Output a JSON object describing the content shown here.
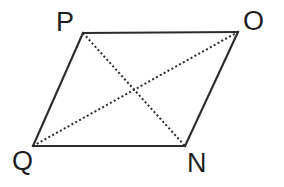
{
  "figure": {
    "kind": "parallelogram-with-diagonals",
    "background_color": "#ffffff",
    "stroke_color": "#2b2b2b",
    "label_color": "#1f1f1f",
    "width": 284,
    "height": 187,
    "vertices": [
      {
        "name": "P",
        "label": "P",
        "x": 83,
        "y": 33,
        "label_x": 56,
        "label_y": 9
      },
      {
        "name": "O",
        "label": "O",
        "x": 238,
        "y": 32,
        "label_x": 243,
        "label_y": 8
      },
      {
        "name": "N",
        "label": "N",
        "x": 185,
        "y": 146,
        "label_x": 187,
        "label_y": 150
      },
      {
        "name": "Q",
        "label": "Q",
        "x": 33,
        "y": 146,
        "label_x": 12,
        "label_y": 148
      }
    ],
    "edges": [
      {
        "name": "edge-PO",
        "from": "P",
        "to": "O",
        "style": "solid",
        "x1": 83,
        "y1": 33,
        "x2": 238,
        "y2": 32
      },
      {
        "name": "edge-ON",
        "from": "O",
        "to": "N",
        "style": "solid",
        "x1": 238,
        "y1": 32,
        "x2": 185,
        "y2": 146
      },
      {
        "name": "edge-NQ",
        "from": "N",
        "to": "Q",
        "style": "solid",
        "x1": 185,
        "y1": 146,
        "x2": 33,
        "y2": 146
      },
      {
        "name": "edge-QP",
        "from": "Q",
        "to": "P",
        "style": "solid",
        "x1": 33,
        "y1": 146,
        "x2": 83,
        "y2": 33
      }
    ],
    "diagonals": [
      {
        "name": "diagonal-PN",
        "from": "P",
        "to": "N",
        "style": "dotted",
        "x1": 83,
        "y1": 33,
        "x2": 185,
        "y2": 146
      },
      {
        "name": "diagonal-QO",
        "from": "Q",
        "to": "O",
        "style": "dotted",
        "x1": 33,
        "y1": 146,
        "x2": 238,
        "y2": 32
      }
    ],
    "intersection": {
      "name": "diagonal-intersection",
      "x": 133,
      "y": 93
    }
  }
}
